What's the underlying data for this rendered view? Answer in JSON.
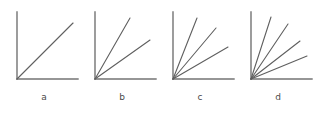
{
  "figure": {
    "background_color": "#ffffff",
    "axis_color": "#737373",
    "ray_color": "#5f5f5f",
    "label_color": "#4a4a4a",
    "panel_count": 4
  },
  "chart_data": {
    "type": "line",
    "title": "",
    "subtitle": "",
    "xlabel": "",
    "ylabel": "",
    "grid": false,
    "legend": "none",
    "panels": [
      {
        "label": "a",
        "label_x": 44,
        "label_y": 100,
        "origin_x": 17,
        "origin_y": 79,
        "axis_top_y": 12,
        "axis_right_x": 78,
        "ray_count": 1,
        "ray_angles_deg": [
          45
        ],
        "rays": [
          {
            "angle_deg": 45,
            "end_x": 73,
            "end_y": 23
          }
        ]
      },
      {
        "label": "b",
        "label_x": 122,
        "label_y": 100,
        "origin_x": 95,
        "origin_y": 79,
        "axis_top_y": 12,
        "axis_right_x": 156,
        "ray_count": 2,
        "ray_angles_deg": [
          60,
          33
        ],
        "rays": [
          {
            "angle_deg": 60,
            "end_x": 130,
            "end_y": 18
          },
          {
            "angle_deg": 33,
            "end_x": 150,
            "end_y": 40
          }
        ]
      },
      {
        "label": "c",
        "label_x": 200,
        "label_y": 100,
        "origin_x": 173,
        "origin_y": 79,
        "axis_top_y": 12,
        "axis_right_x": 234,
        "ray_count": 3,
        "ray_angles_deg": [
          68,
          50,
          30
        ],
        "rays": [
          {
            "angle_deg": 68,
            "end_x": 197,
            "end_y": 18
          },
          {
            "angle_deg": 50,
            "end_x": 216,
            "end_y": 28
          },
          {
            "angle_deg": 30,
            "end_x": 228,
            "end_y": 47
          }
        ]
      },
      {
        "label": "d",
        "label_x": 278,
        "label_y": 100,
        "origin_x": 251,
        "origin_y": 79,
        "axis_top_y": 12,
        "axis_right_x": 312,
        "ray_count": 4,
        "ray_angles_deg": [
          72,
          57,
          38,
          22
        ],
        "rays": [
          {
            "angle_deg": 72,
            "end_x": 271,
            "end_y": 17
          },
          {
            "angle_deg": 57,
            "end_x": 288,
            "end_y": 24
          },
          {
            "angle_deg": 38,
            "end_x": 300,
            "end_y": 41
          },
          {
            "angle_deg": 22,
            "end_x": 307,
            "end_y": 56
          }
        ]
      }
    ]
  }
}
